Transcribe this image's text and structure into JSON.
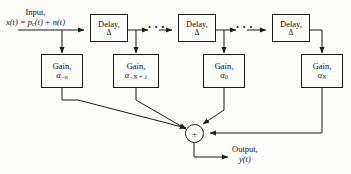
{
  "diagram": {
    "stroke_color": "#1a1a1a",
    "background_color": "#fdfdfc",
    "input": {
      "line1": "Input,",
      "line2_lhs": "x(t) = p",
      "line2_sub": "c",
      "line2_rhs": "(t) + n(t)"
    },
    "output": {
      "line1": "Output,",
      "line2": "y(t)"
    },
    "delays": [
      {
        "label": "Delay,",
        "value": "Δ"
      },
      {
        "label": "Delay,",
        "value": "Δ"
      },
      {
        "label": "Delay,",
        "value": "Δ"
      }
    ],
    "gains": [
      {
        "label": "Gain,",
        "symbol": "α",
        "subscript": "−n"
      },
      {
        "label": "Gain,",
        "symbol": "α",
        "subscript": "−N + 1"
      },
      {
        "label": "Gain,",
        "symbol": "α",
        "subscript": "0"
      },
      {
        "label": "Gain,",
        "symbol": "α",
        "subscript": "N"
      }
    ],
    "summer": {
      "symbol": "+"
    },
    "ellipses": [
      {
        "dots": "• • •"
      },
      {
        "dots": "• • •"
      }
    ]
  }
}
